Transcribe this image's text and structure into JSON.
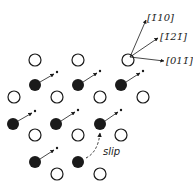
{
  "diagram": {
    "colors": {
      "ink": "#1a1a1a",
      "background": "#ffffff"
    },
    "atom_radius": 6,
    "open_atoms": [
      {
        "x": 35,
        "y": 60
      },
      {
        "x": 78,
        "y": 60
      },
      {
        "x": 128,
        "y": 60
      },
      {
        "x": 14,
        "y": 97
      },
      {
        "x": 57,
        "y": 97
      },
      {
        "x": 100,
        "y": 97
      },
      {
        "x": 143,
        "y": 97
      },
      {
        "x": 35,
        "y": 135
      },
      {
        "x": 78,
        "y": 135
      },
      {
        "x": 121,
        "y": 135
      },
      {
        "x": 57,
        "y": 174
      },
      {
        "x": 100,
        "y": 174
      }
    ],
    "filled_atoms": [
      {
        "x": 35,
        "y": 85,
        "tx": 57,
        "ty": 72
      },
      {
        "x": 78,
        "y": 85,
        "tx": 100,
        "ty": 71
      },
      {
        "x": 121,
        "y": 85,
        "tx": 143,
        "ty": 71
      },
      {
        "x": 13,
        "y": 124,
        "tx": 35,
        "ty": 111
      },
      {
        "x": 56,
        "y": 124,
        "tx": 78,
        "ty": 110
      },
      {
        "x": 100,
        "y": 124,
        "tx": 121,
        "ty": 110
      },
      {
        "x": 35,
        "y": 162,
        "tx": 57,
        "ty": 148
      },
      {
        "x": 78,
        "y": 162,
        "tx": 0,
        "ty": 0
      }
    ],
    "directions": [
      {
        "label": "[1̄10]",
        "x2": 146,
        "y2": 20,
        "lx": 147,
        "ly": 21
      },
      {
        "label": "[1̄21̄]",
        "x2": 158,
        "y2": 38,
        "lx": 160,
        "ly": 40
      },
      {
        "label": "[011̄]",
        "x2": 164,
        "y2": 61,
        "lx": 166,
        "ly": 64
      }
    ],
    "slip": {
      "label": "slip",
      "x": 103,
      "y": 155
    }
  }
}
